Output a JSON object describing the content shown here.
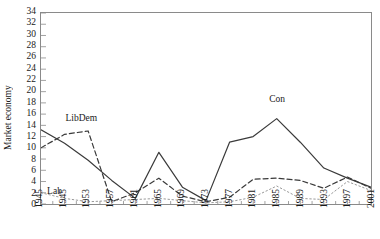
{
  "figure": {
    "cropped_caption_fragment": "",
    "ylabel": "Market economy"
  },
  "chart_data": {
    "type": "line",
    "title": "",
    "xlabel": "",
    "ylabel": "Market economy",
    "ylim": [
      0,
      34
    ],
    "xlim": [
      1945,
      2001
    ],
    "grid": false,
    "legend": "inline-annotations",
    "ytick_labels": [
      "0",
      "2",
      "4",
      "6",
      "8",
      "10",
      "12",
      "14",
      "16",
      "18",
      "20",
      "22",
      "24",
      "26",
      "28",
      "30",
      "32",
      "34"
    ],
    "yticks": [
      0,
      2,
      4,
      6,
      8,
      10,
      12,
      14,
      16,
      18,
      20,
      22,
      24,
      26,
      28,
      30,
      32,
      34
    ],
    "xtick_labels": [
      "1945",
      "1945",
      "1953",
      "1957",
      "1961",
      "1965",
      "1969",
      "1973",
      "1977",
      "1981",
      "1985",
      "1989",
      "1993",
      "1997",
      "2001"
    ],
    "xticks": [
      1945,
      1949,
      1953,
      1957,
      1961,
      1965,
      1969,
      1973,
      1977,
      1981,
      1985,
      1989,
      1993,
      1997,
      2001
    ],
    "x": [
      1945,
      1949,
      1953,
      1957,
      1961,
      1965,
      1969,
      1973,
      1977,
      1981,
      1985,
      1989,
      1993,
      1997,
      2001
    ],
    "series": [
      {
        "name": "Con",
        "style": "solid",
        "color": "#3a3a3a",
        "annotation": "Con",
        "values": [
          13.2,
          10.8,
          7.8,
          4.2,
          1.0,
          9.2,
          3.0,
          0.6,
          11.0,
          12.0,
          15.2,
          11.0,
          6.4,
          4.6,
          3.0
        ]
      },
      {
        "name": "LibDem",
        "style": "dashed",
        "color": "#3a3a3a",
        "annotation": "LibDem",
        "values": [
          10.0,
          12.4,
          13.0,
          0.4,
          2.0,
          4.6,
          1.4,
          0.4,
          1.2,
          4.4,
          4.6,
          4.2,
          2.8,
          4.8,
          2.8
        ]
      },
      {
        "name": "Lab",
        "style": "dotted",
        "color": "#9a9a9a",
        "annotation": "Lab",
        "values": [
          2.0,
          1.0,
          0.4,
          0.6,
          0.8,
          1.0,
          0.6,
          0.2,
          0.4,
          1.2,
          3.2,
          1.0,
          0.8,
          4.0,
          2.4
        ]
      }
    ]
  }
}
